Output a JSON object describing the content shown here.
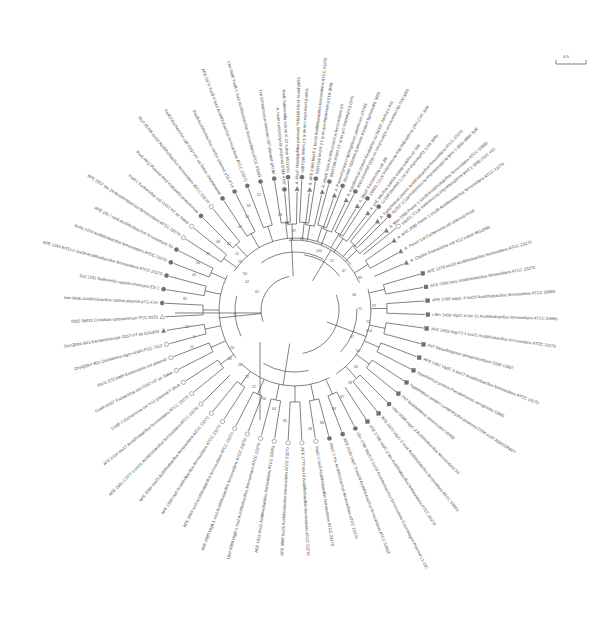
{
  "figure": {
    "tree_type": "unrooted-radial",
    "scale_label": "0.5",
    "center": {
      "x": 295,
      "y": 310
    },
    "marker_legend": [
      {
        "symbol": "filled-circle",
        "name": "filled-circle-marker"
      },
      {
        "symbol": "open-circle",
        "name": "open-circle-marker"
      },
      {
        "symbol": "filled-triangle",
        "name": "filled-triangle-marker"
      },
      {
        "symbol": "open-triangle",
        "name": "open-triangle-marker"
      }
    ]
  },
  "chart_data": {
    "type": "tree",
    "n_taxa": 72,
    "taxa": [
      {
        "i": 0,
        "angle": -95,
        "r": 118,
        "marker": "filled-circle",
        "label": "A. toxin Lamprocystis purpurea DSM 4197"
      },
      {
        "i": 1,
        "angle": -89,
        "r": 118,
        "marker": "filled-triangle",
        "label": "A. MazF Haemophilus parasuis SH0165 M1-H KuenhiAR3"
      },
      {
        "i": 2,
        "angle": -83,
        "r": 118,
        "marker": "filled-triangle",
        "label": "A. AFE 1366 MazF-1 tox35 Acidithiobacillus ferrooxidans ATCC 23270"
      },
      {
        "i": 3,
        "angle": -77,
        "r": 118,
        "marker": "filled-triangle",
        "label": "A. MazE toxin Acidithiobacillus ferrooxidans 53"
      },
      {
        "i": 4,
        "angle": -71,
        "r": 118,
        "marker": "filled-triangle",
        "label": "A. Plasmid protein Sphingobium japonicum UT26S"
      },
      {
        "i": 5,
        "angle": -65,
        "r": 118,
        "marker": "filled-triangle",
        "label": "A. hypothetical protein Geobacter sp SCGC AAA010-A01"
      },
      {
        "i": 6,
        "angle": -59,
        "r": 118,
        "marker": "filled-triangle",
        "label": "A. MazF Escherichia coli JM"
      },
      {
        "i": 7,
        "angle": -53,
        "r": 118,
        "marker": "filled-triangle",
        "label": "A. ynE Bacillus subtilis subsp subtilis str 168"
      },
      {
        "i": 8,
        "angle": -47,
        "r": 118,
        "marker": "filled-triangle",
        "label": "A. hypothetical protein Acidithiobacillus ferrooxidans ATCC 23270"
      },
      {
        "i": 9,
        "angle": -41,
        "r": 118,
        "marker": "filled-triangle",
        "label": "A. Mvn 2586 PemK-1 tox30 Acidithiobacillus ferrooxidans ATCC 53993"
      },
      {
        "i": 10,
        "angle": -35,
        "r": 118,
        "marker": "filled-triangle",
        "label": "A. AFE 2890 PemK-1 tox30 Acidithiobacillus ferrooxidans ATCC 23270"
      },
      {
        "i": 11,
        "angle": -29,
        "r": 118,
        "marker": "filled-triangle",
        "label": "A. PemK Kid Escherichia coli plasmid R100"
      },
      {
        "i": 12,
        "angle": -23,
        "r": 118,
        "marker": "filled-triangle",
        "label": "A. ChpBK Escherichia coli K12 substr MG1655"
      },
      {
        "i": 13,
        "angle": -16,
        "r": 130,
        "marker": "filled-square",
        "label": "AFE 1378 tox10 Acidithiobacillus ferrooxidans ATCC 23270"
      },
      {
        "i": 14,
        "angle": -10,
        "r": 130,
        "marker": "filled-square",
        "label": "AFE 0366 tox1 Acidithiobacillus ferrooxidans ATCC 23270"
      },
      {
        "i": 15,
        "angle": -4,
        "r": 130,
        "marker": "filled-square",
        "label": "AFE 1780 VapC-4 tox15 Acidithiobacillus ferrooxidans ATCC 53993"
      },
      {
        "i": 16,
        "angle": 2,
        "r": 130,
        "marker": "filled-square",
        "label": "Lferr 1456 VapC-4 tox 15 Acidithiobacillus ferrooxidans ATCC 53993"
      },
      {
        "i": 17,
        "angle": 8,
        "r": 130,
        "marker": "filled-square",
        "label": "AFE 2935 NapT2-1 tox21 Acidithiobacillus ferrooxidans ATCC 23270"
      },
      {
        "i": 18,
        "angle": 15,
        "r": 130,
        "marker": "filled-square",
        "label": "PilT Desulfotignum phosphitoxidans DSM 13687"
      },
      {
        "i": 19,
        "angle": 21,
        "r": 130,
        "marker": "filled-square",
        "label": "AFE 1362 VapC-3 tox27 Acidithiobacillus ferrooxidans ATCC 23270"
      },
      {
        "i": 20,
        "angle": 27,
        "r": 130,
        "marker": "filled-square",
        "label": "hypothetical protein Pseudomonas aeruginosa C9M1"
      },
      {
        "i": 21,
        "angle": 33,
        "r": 130,
        "marker": "filled-square",
        "label": "hypothetical protein Lamprocystis purpurea DSM 4197 A39GDRAFT"
      },
      {
        "i": 22,
        "angle": 39,
        "r": 130,
        "marker": "filled-square",
        "label": "PilT Burkholderia xenovorans LB400"
      },
      {
        "i": 23,
        "angle": 45,
        "r": 130,
        "marker": "filled-square",
        "label": "Lferr 0598 VapC-2 Acidithiobacillus ferrooxidans 53"
      },
      {
        "i": 24,
        "angle": 51,
        "r": 130,
        "marker": "filled-square",
        "label": "AFE 0473 VapC-2 tox4 Acidithiobacillus ferrooxidans ATCC 53993"
      },
      {
        "i": 25,
        "angle": 57,
        "r": 130,
        "marker": "filled-square",
        "label": "AFE 1788 VapC-2 tox Acidithiobacillus ferrooxidans ATCC 23270"
      },
      {
        "i": 26,
        "angle": 63,
        "r": 130,
        "marker": "filled-circle",
        "label": "Lfer 1786 VapC-5 tox16 Acidithiobacillus ferrooxidans Copenhagen Plasmid L1-130"
      },
      {
        "i": 27,
        "angle": 69,
        "r": 130,
        "marker": "filled-circle",
        "label": "AFE 2129 VapC-5 tox16 Acidithiobacillus ferrooxidans ATCC 53993"
      },
      {
        "i": 28,
        "angle": 75,
        "r": 130,
        "marker": "filled-circle",
        "label": "VapC-1 tox Acidithiobacillus ferrooxidans ATCC 23270"
      },
      {
        "i": 29,
        "angle": 81,
        "r": 130,
        "marker": "open-circle",
        "label": "VapC-1 tox3 Acidithiobacillus ferrooxidans ATCC 23270"
      },
      {
        "i": 30,
        "angle": 87,
        "r": 130,
        "marker": "open-circle",
        "label": "AFE 1773 tox14 Acidithiobacillus ferrooxidans ATCC 23270"
      },
      {
        "i": 31,
        "angle": 93,
        "r": 130,
        "marker": "open-circle",
        "label": "AFE 3099 tox25 Acidithiobacillus ferrooxidans ATCC 23270"
      },
      {
        "i": 32,
        "angle": 99,
        "r": 130,
        "marker": "open-circle",
        "label": "AFE 1613 tox11 Acidithiobacillus ferrooxidans ATCC 53993"
      },
      {
        "i": 33,
        "angle": 105,
        "r": 130,
        "marker": "open-circle",
        "label": "Lferr 0980 HigB-1 tox2 Acidithiobacillus ferrooxidans ATCC 23270"
      },
      {
        "i": 34,
        "angle": 111,
        "r": 130,
        "marker": "open-circle",
        "label": "AFE 0980 HigB-1 tox2 Acidithiobacillus ferrooxidans ATCC 23270"
      },
      {
        "i": 35,
        "angle": 117,
        "r": 130,
        "marker": "open-circle",
        "label": "AFE 1559 tox9 Acidithiobacillus ferrooxidans ATCC 23270"
      },
      {
        "i": 36,
        "angle": 123,
        "r": 130,
        "marker": "open-circle",
        "label": "AFE 1388 tox8 Acidithiobacillus ferrooxidans ATCC 23270"
      },
      {
        "i": 37,
        "angle": 129,
        "r": 130,
        "marker": "open-circle",
        "label": "AFE 2084 tox23 Acidithiobacillus ferrooxidans ATCC 23270"
      },
      {
        "i": 38,
        "angle": 135,
        "r": 130,
        "marker": "open-circle",
        "label": "AFE 2981 COTY-1 tox31 Acidithiobacillus ferrooxidans ATCC 23270"
      },
      {
        "i": 39,
        "angle": 141,
        "r": 130,
        "marker": "open-circle",
        "label": "AFE 2414 tox17 Acidithiobacillus ferrooxidans ATCC 23270"
      },
      {
        "i": 40,
        "angle": 147,
        "r": 130,
        "marker": "open-circle",
        "label": "CcdB-1 Escherichia coli K12 plasmid F DNA"
      },
      {
        "i": 41,
        "angle": 153,
        "r": 130,
        "marker": "open-circle",
        "label": "CcdB-O157 Escherichia coli O157:H7 str Sakai"
      },
      {
        "i": 42,
        "angle": 159,
        "r": 130,
        "marker": "open-circle",
        "label": "Rorf1 ESCAMP Escherichia coli plasmid"
      },
      {
        "i": 43,
        "angle": 165,
        "r": 130,
        "marker": "open-circle",
        "label": "OxyQDb4 9D1 Oscillatoria nigro-viridis PCC 7112"
      },
      {
        "i": 44,
        "angle": 171,
        "r": 130,
        "marker": "filled-triangle",
        "label": "OxyQDb4 9D1 Escherichia coli O157:H7 str EDL933"
      },
      {
        "i": 45,
        "angle": 177,
        "r": 130,
        "marker": "open-triangle",
        "label": "RDD 36431 Crinalium epipsammum PCC 9333"
      },
      {
        "i": 46,
        "angle": 183,
        "r": 130,
        "marker": "filled-circle",
        "label": "ban RelE Acidithiobacillus caldus plasmid pTC-F14"
      },
      {
        "i": 47,
        "angle": 189,
        "r": 130,
        "marker": "filled-circle",
        "label": "Gsf 2192 Gallionella capsiferriformans ES-2"
      },
      {
        "i": 48,
        "angle": 195,
        "r": 130,
        "marker": "filled-circle",
        "label": "AFE 1364 Ecf11-1 tox29 Acidithiobacillus ferrooxidans ATCC 23270"
      },
      {
        "i": 49,
        "angle": 201,
        "r": 130,
        "marker": "filled-circle",
        "label": "Acifa 2204 Acidithiobacillus ferrooxidans ATCC 23270"
      },
      {
        "i": 50,
        "angle": 207,
        "r": 130,
        "marker": "filled-circle",
        "label": "AFE 1417 tox6 Acidithiobacillus ferrooxidans 53"
      },
      {
        "i": 51,
        "angle": 213,
        "r": 130,
        "marker": "open-circle",
        "label": "AFE 2657 tox 19 Acidithiobacillus ferrooxidans ATCC 23270"
      },
      {
        "i": 52,
        "angle": 219,
        "r": 130,
        "marker": "open-circle",
        "label": "ParE1 Escherichia coli O157:H7 str Sakai"
      },
      {
        "i": 53,
        "angle": 225,
        "r": 130,
        "marker": "filled-circle",
        "label": "ParE-RK2 Plasmid RK2 Klebsiella pneumoniae"
      },
      {
        "i": 54,
        "angle": 231,
        "r": 130,
        "marker": "open-circle",
        "label": "Rorf 25766 tox12 Acidithiobacillus ferrooxidans ATCC 23270"
      },
      {
        "i": 55,
        "angle": 237,
        "r": 130,
        "marker": "filled-circle",
        "label": "ParE3 Escherichia coli O157:H7 str Sakai chromosome"
      },
      {
        "i": 56,
        "angle": 243,
        "r": 130,
        "marker": "filled-circle",
        "label": "PasB Acidithiobacillus caldus plasmid pTC-F14"
      },
      {
        "i": 57,
        "angle": 249,
        "r": 130,
        "marker": "filled-circle",
        "label": "AFE 0970 YoeB-1 tox2 Acidithiobacillus ferrooxidans ATCC 23270"
      },
      {
        "i": 58,
        "angle": 255,
        "r": 130,
        "marker": "filled-circle",
        "label": "Lfer 0995 YoeB-1 tox5 Acidithiobacillus ferrooxidans ATCC 53993"
      },
      {
        "i": 59,
        "angle": 261,
        "r": 130,
        "marker": "filled-circle",
        "label": "Txe Enterococcus faecium U37 plasmid pRUM"
      },
      {
        "i": 60,
        "angle": 267,
        "r": 130,
        "marker": "filled-circle",
        "label": "YoeB Salmonella coli str K-12 substr MG1655"
      },
      {
        "i": 61,
        "angle": 273,
        "r": 130,
        "marker": "filled-circle",
        "label": "YoeB Escherichia coli str K-12 substr MG1655"
      },
      {
        "i": 62,
        "angle": 279,
        "r": 130,
        "marker": "filled-circle",
        "label": "RelE-K12 Escherichia coli str K-12 substr MG1655"
      },
      {
        "i": 63,
        "angle": 285,
        "r": 130,
        "marker": "filled-circle",
        "label": "YacD Escherichia coli str K-12 substr MG1655"
      },
      {
        "i": 64,
        "angle": 291,
        "r": 130,
        "marker": "filled-circle",
        "label": "StbE Salmonella enterica serovar Enteritidis plasmid"
      },
      {
        "i": 65,
        "angle": 297,
        "r": 130,
        "marker": "filled-circle",
        "label": "StbE-Axy Mycobacterium tuberculosis str M2D plasmid DNA"
      },
      {
        "i": 66,
        "angle": 303,
        "r": 130,
        "marker": "filled-circle",
        "label": "AFE 1417 tox7 Acidithiobacillus ferrooxidans ATCC 53993"
      },
      {
        "i": 67,
        "angle": 309,
        "r": 130,
        "marker": "filled-circle",
        "label": "RelE 9571 Escherichia coli 8171 plasmid p9171"
      },
      {
        "i": 68,
        "angle": 315,
        "r": 130,
        "marker": "filled-circle",
        "label": "AFE 0880 StbE-1 tox6 Acidithiobacillus ferrooxidans ATCC 23270"
      },
      {
        "i": 69,
        "angle": 321,
        "r": 130,
        "marker": "open-circle",
        "label": "Lfer 1012 StbE-1 tox6 Acidithiobacillus ferrooxidans ATCC 53993"
      }
    ],
    "bootstrap_values": [
      {
        "v": "71",
        "x": 233,
        "y": 316
      },
      {
        "v": "71",
        "x": 358,
        "y": 310
      },
      {
        "v": "97",
        "x": 372,
        "y": 307
      },
      {
        "v": "72",
        "x": 366,
        "y": 323
      },
      {
        "v": "654",
        "x": 366,
        "y": 332
      },
      {
        "v": "89",
        "x": 358,
        "y": 279
      },
      {
        "v": "62",
        "x": 255,
        "y": 293
      },
      {
        "v": "22",
        "x": 245,
        "y": 283
      },
      {
        "v": "50",
        "x": 243,
        "y": 275
      },
      {
        "v": "75",
        "x": 238,
        "y": 263
      },
      {
        "v": "15",
        "x": 235,
        "y": 255
      },
      {
        "v": "42",
        "x": 227,
        "y": 245
      },
      {
        "v": "43",
        "x": 192,
        "y": 276
      },
      {
        "v": "85",
        "x": 183,
        "y": 300
      },
      {
        "v": "50",
        "x": 196,
        "y": 264
      },
      {
        "v": "23",
        "x": 206,
        "y": 255
      },
      {
        "v": "43",
        "x": 216,
        "y": 243
      },
      {
        "v": "62",
        "x": 247,
        "y": 207
      },
      {
        "v": "14",
        "x": 245,
        "y": 218
      },
      {
        "v": "42",
        "x": 238,
        "y": 228
      },
      {
        "v": "22",
        "x": 257,
        "y": 196
      },
      {
        "v": "52",
        "x": 185,
        "y": 328
      },
      {
        "v": "9",
        "x": 193,
        "y": 338
      },
      {
        "v": "11",
        "x": 190,
        "y": 348
      },
      {
        "v": "50",
        "x": 230,
        "y": 349
      },
      {
        "v": "65",
        "x": 228,
        "y": 360
      },
      {
        "v": "26",
        "x": 238,
        "y": 366
      },
      {
        "v": "22",
        "x": 245,
        "y": 378
      },
      {
        "v": "22",
        "x": 252,
        "y": 388
      },
      {
        "v": "96",
        "x": 262,
        "y": 400
      },
      {
        "v": "64",
        "x": 272,
        "y": 410
      },
      {
        "v": "85",
        "x": 283,
        "y": 422
      },
      {
        "v": "43",
        "x": 308,
        "y": 430
      },
      {
        "v": "86",
        "x": 320,
        "y": 424
      },
      {
        "v": "83",
        "x": 332,
        "y": 410
      },
      {
        "v": "67",
        "x": 340,
        "y": 398
      },
      {
        "v": "58",
        "x": 348,
        "y": 384
      },
      {
        "v": "62",
        "x": 354,
        "y": 368
      },
      {
        "v": "50",
        "x": 356,
        "y": 352
      },
      {
        "v": "47",
        "x": 350,
        "y": 338
      },
      {
        "v": "36",
        "x": 300,
        "y": 240
      },
      {
        "v": "37",
        "x": 292,
        "y": 232
      },
      {
        "v": "50",
        "x": 285,
        "y": 224
      },
      {
        "v": "28",
        "x": 278,
        "y": 216
      },
      {
        "v": "100",
        "x": 316,
        "y": 252
      },
      {
        "v": "52",
        "x": 330,
        "y": 262
      },
      {
        "v": "47",
        "x": 342,
        "y": 272
      },
      {
        "v": "34",
        "x": 352,
        "y": 296
      }
    ]
  }
}
